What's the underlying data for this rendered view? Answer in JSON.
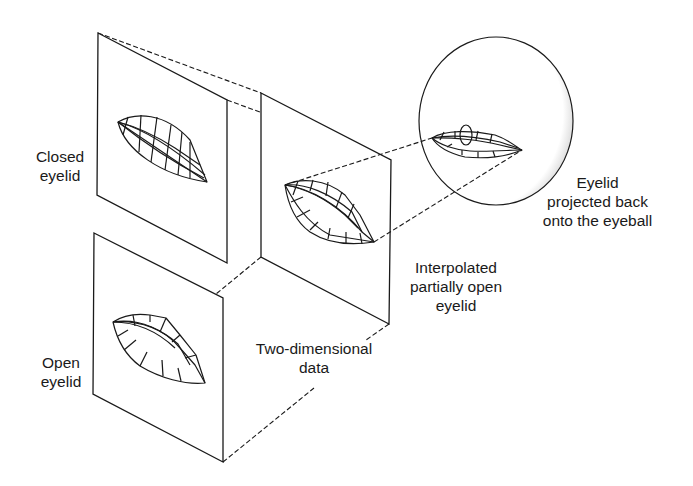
{
  "diagram": {
    "colors": {
      "line": "#1a1a1a",
      "background": "#ffffff",
      "shade": "#8a8a8a"
    },
    "nodes": [
      {
        "id": "closed",
        "label_lines": [
          "Closed",
          "eyelid"
        ],
        "kind": "2d-panel"
      },
      {
        "id": "open",
        "label_lines": [
          "Open",
          "eyelid"
        ],
        "kind": "2d-panel"
      },
      {
        "id": "interpolated",
        "label_lines": [
          "Interpolated",
          "partially open",
          "eyelid"
        ],
        "kind": "2d-panel"
      },
      {
        "id": "eyeball",
        "label_lines": [
          "Eyelid",
          "projected back",
          "onto the eyeball"
        ],
        "kind": "sphere"
      }
    ],
    "annotations": [
      {
        "id": "two-d",
        "label_lines": [
          "Two-dimensional",
          "data"
        ]
      }
    ],
    "edges": [
      {
        "from": "closed",
        "to": "interpolated",
        "style": "dashed"
      },
      {
        "from": "open",
        "to": "interpolated",
        "style": "dashed"
      },
      {
        "from": "interpolated",
        "to": "eyeball",
        "style": "dashed"
      }
    ]
  }
}
